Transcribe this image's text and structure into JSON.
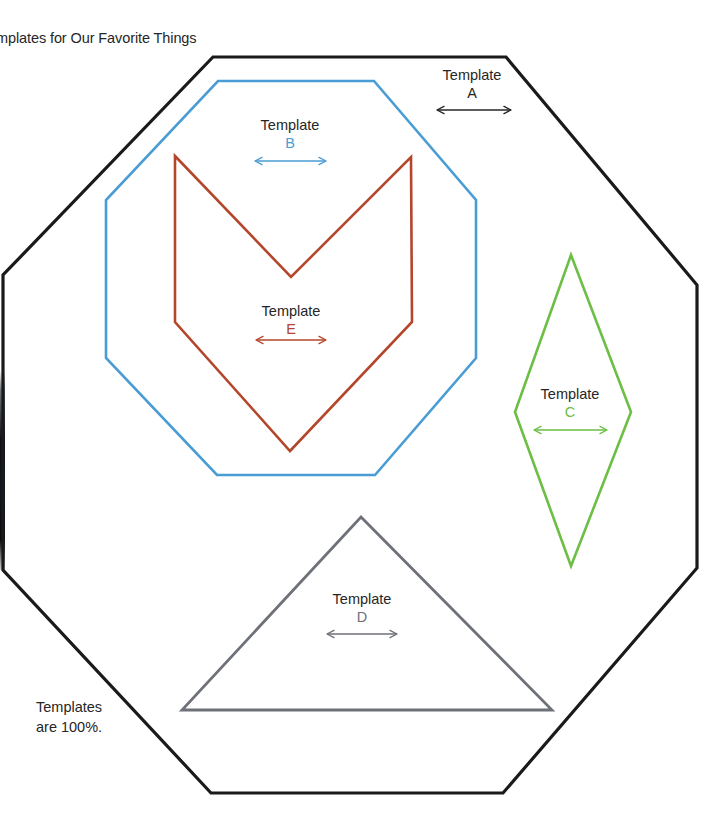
{
  "slide": {
    "title": "emplates for Our Favorite Things",
    "footnote_line1": "Templates",
    "footnote_line2": "are 100%."
  },
  "colors": {
    "black": "#1a1a1a",
    "blue": "#4a9cd4",
    "rust": "#b4462b",
    "green": "#6cbe45",
    "gray": "#6e7178",
    "text": "#262626",
    "background": "#ffffff"
  },
  "labels": [
    {
      "id": "a",
      "word": "Template",
      "letter": "A",
      "letter_color": "#262626",
      "arrow_color": "#262626"
    },
    {
      "id": "b",
      "word": "Template",
      "letter": "B",
      "letter_color": "#4a9cd4",
      "arrow_color": "#4a9cd4"
    },
    {
      "id": "c",
      "word": "Template",
      "letter": "C",
      "letter_color": "#6cbe45",
      "arrow_color": "#6cbe45"
    },
    {
      "id": "d",
      "word": "Template",
      "letter": "D",
      "letter_color": "#6e7178",
      "arrow_color": "#6e7178"
    },
    {
      "id": "e",
      "word": "Template",
      "letter": "E",
      "letter_color": "#b4462b",
      "arrow_color": "#b4462b"
    }
  ],
  "shapes": [
    {
      "id": "octagon-a",
      "name": "Template A",
      "kind": "octagon",
      "stroke": "#1a1a1a",
      "stroke_width": 3.2,
      "points": "213,57 506,57 697,285 697,568 503,793 211,793 3,570 3,275"
    },
    {
      "id": "octagon-b",
      "name": "Template B",
      "kind": "octagon",
      "stroke": "#4a9cd4",
      "stroke_width": 2.6,
      "points": "218,81 374,81 476,200 476,358 375,475 217,475 106,358 106,200"
    },
    {
      "id": "chevron-e",
      "name": "Template E",
      "kind": "chevron",
      "stroke": "#b4462b",
      "stroke_width": 2.6,
      "points": "175,156 291,277 411,157 412,322 290,451 175,322"
    },
    {
      "id": "diamond-c",
      "name": "Template C",
      "kind": "diamond",
      "stroke": "#6cbe45",
      "stroke_width": 2.6,
      "points": "571,255 631,412 571,566 515,412"
    },
    {
      "id": "triangle-d",
      "name": "Template D",
      "kind": "triangle",
      "stroke": "#6e7178",
      "stroke_width": 2.8,
      "points": "361,517 552,710 182,710"
    }
  ],
  "arrows": [
    {
      "id": "a",
      "x1": 437,
      "y1": 110,
      "x2": 511,
      "y2": 110,
      "color": "#262626"
    },
    {
      "id": "b",
      "x1": 255,
      "y1": 161,
      "x2": 326,
      "y2": 161,
      "color": "#4a9cd4"
    },
    {
      "id": "c",
      "x1": 534,
      "y1": 430,
      "x2": 607,
      "y2": 430,
      "color": "#6cbe45"
    },
    {
      "id": "d",
      "x1": 327,
      "y1": 634,
      "x2": 397,
      "y2": 634,
      "color": "#6e7178"
    },
    {
      "id": "e",
      "x1": 256,
      "y1": 340,
      "x2": 326,
      "y2": 340,
      "color": "#b4462b"
    }
  ]
}
